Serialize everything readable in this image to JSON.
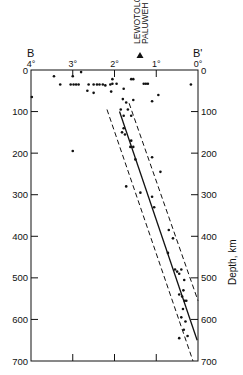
{
  "chart_data": {
    "type": "scatter",
    "title": "",
    "section_labels": {
      "left": "B",
      "right": "B'"
    },
    "annotation": {
      "labels": [
        "LEWOTOLO",
        "PALUWEH"
      ],
      "marker": "triangle",
      "position_deg": 1.4
    },
    "xlabel": "",
    "ylabel": "Depth, km",
    "x_ticks": [
      "4°",
      "3°",
      "2°",
      "1°",
      "0°"
    ],
    "x_tick_values": [
      4,
      3,
      2,
      1,
      0
    ],
    "y_ticks_left": [
      "0",
      "100",
      "200",
      "300",
      "400",
      "500",
      "600",
      "700"
    ],
    "y_ticks_right": [
      "0",
      "100",
      "200",
      "300",
      "400",
      "500",
      "600",
      "700"
    ],
    "y_tick_values": [
      0,
      100,
      200,
      300,
      400,
      500,
      600,
      700
    ],
    "xlim": [
      4,
      0
    ],
    "ylim": [
      0,
      700
    ],
    "grid": false,
    "points": [
      {
        "x": 3.45,
        "y": 15
      },
      {
        "x": 3.0,
        "y": 15
      },
      {
        "x": 2.8,
        "y": 5
      },
      {
        "x": 3.3,
        "y": 35
      },
      {
        "x": 3.05,
        "y": 35
      },
      {
        "x": 2.98,
        "y": 35
      },
      {
        "x": 2.92,
        "y": 35
      },
      {
        "x": 2.86,
        "y": 35
      },
      {
        "x": 2.62,
        "y": 35
      },
      {
        "x": 2.5,
        "y": 35
      },
      {
        "x": 2.42,
        "y": 35
      },
      {
        "x": 2.36,
        "y": 35
      },
      {
        "x": 2.28,
        "y": 35
      },
      {
        "x": 2.22,
        "y": 37
      },
      {
        "x": 2.1,
        "y": 35
      },
      {
        "x": 2.05,
        "y": 22
      },
      {
        "x": 2.05,
        "y": 33
      },
      {
        "x": 1.95,
        "y": 33
      },
      {
        "x": 2.65,
        "y": 50
      },
      {
        "x": 2.5,
        "y": 55
      },
      {
        "x": 2.08,
        "y": 52
      },
      {
        "x": 1.78,
        "y": 45
      },
      {
        "x": 1.6,
        "y": 22
      },
      {
        "x": 1.55,
        "y": 22
      },
      {
        "x": 1.3,
        "y": 33
      },
      {
        "x": 1.25,
        "y": 33
      },
      {
        "x": 1.2,
        "y": 33
      },
      {
        "x": 0.95,
        "y": 60
      },
      {
        "x": 0.17,
        "y": 35
      },
      {
        "x": 3.98,
        "y": 65
      },
      {
        "x": 1.8,
        "y": 70
      },
      {
        "x": 1.72,
        "y": 78
      },
      {
        "x": 1.55,
        "y": 72
      },
      {
        "x": 1.68,
        "y": 95
      },
      {
        "x": 1.85,
        "y": 95
      },
      {
        "x": 1.78,
        "y": 110
      },
      {
        "x": 1.6,
        "y": 110
      },
      {
        "x": 1.1,
        "y": 75
      },
      {
        "x": 1.78,
        "y": 140
      },
      {
        "x": 1.82,
        "y": 150
      },
      {
        "x": 1.75,
        "y": 155
      },
      {
        "x": 1.6,
        "y": 170
      },
      {
        "x": 1.62,
        "y": 185
      },
      {
        "x": 1.55,
        "y": 185
      },
      {
        "x": 1.5,
        "y": 215
      },
      {
        "x": 1.1,
        "y": 210
      },
      {
        "x": 0.9,
        "y": 245
      },
      {
        "x": 3.0,
        "y": 195
      },
      {
        "x": 1.72,
        "y": 280
      },
      {
        "x": 1.38,
        "y": 295
      },
      {
        "x": 1.1,
        "y": 305
      },
      {
        "x": 1.05,
        "y": 330
      },
      {
        "x": 0.7,
        "y": 385
      },
      {
        "x": 0.6,
        "y": 405
      },
      {
        "x": 0.72,
        "y": 440
      },
      {
        "x": 0.55,
        "y": 480
      },
      {
        "x": 0.5,
        "y": 485
      },
      {
        "x": 0.45,
        "y": 490
      },
      {
        "x": 0.4,
        "y": 480
      },
      {
        "x": 0.33,
        "y": 505
      },
      {
        "x": 0.35,
        "y": 530
      },
      {
        "x": 0.45,
        "y": 540
      },
      {
        "x": 0.38,
        "y": 545
      },
      {
        "x": 0.32,
        "y": 555
      },
      {
        "x": 0.28,
        "y": 555
      },
      {
        "x": 0.36,
        "y": 575
      },
      {
        "x": 0.4,
        "y": 595
      },
      {
        "x": 0.3,
        "y": 605
      },
      {
        "x": 0.34,
        "y": 625
      },
      {
        "x": 0.45,
        "y": 645
      },
      {
        "x": 0.25,
        "y": 640
      }
    ],
    "lines": [
      {
        "name": "slab-axis",
        "style": "solid",
        "from": {
          "x": 1.88,
          "y": 100
        },
        "to": {
          "x": 0.02,
          "y": 650
        }
      },
      {
        "name": "slab-upper-bound",
        "style": "dashed",
        "from": {
          "x": 2.18,
          "y": 95
        },
        "to": {
          "x": 0.12,
          "y": 700
        }
      },
      {
        "name": "slab-lower-bound",
        "style": "dashed",
        "from": {
          "x": 1.65,
          "y": 80
        },
        "to": {
          "x": 0.0,
          "y": 555
        }
      }
    ]
  }
}
